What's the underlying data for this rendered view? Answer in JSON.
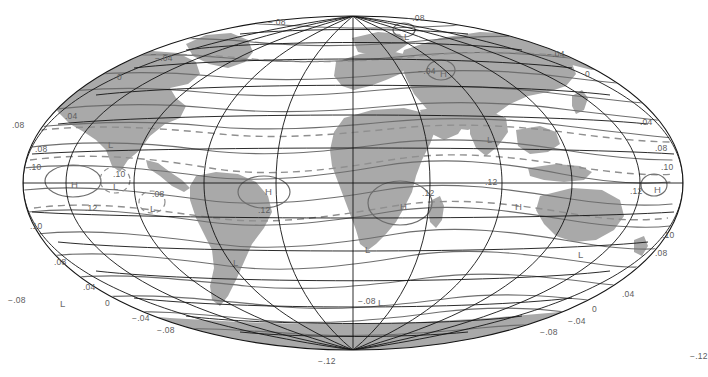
{
  "figure": {
    "type": "world-contour-map",
    "projection": "Mollweide",
    "background_color": "#ffffff",
    "land_fill": "#a9a9a9",
    "graticule_color": "#1a1a1a",
    "contour_color": "#6e6e6e",
    "dashed_contour_color": "#8a8a8a",
    "graticule": {
      "lon_step_deg": 30,
      "lat_step_deg": 30
    }
  },
  "chart_data": {
    "type": "contour",
    "title": "",
    "xlabel": "",
    "ylabel": "",
    "contour_interval": 0.04,
    "contour_levels": [
      -0.12,
      -0.08,
      -0.04,
      0,
      0.04,
      0.08,
      0.1,
      0.12
    ],
    "units": "",
    "extrema_symbols": [
      "H",
      "L"
    ],
    "labels": [
      {
        "text": "−.08",
        "x": 268,
        "y": 18
      },
      {
        "text": "−.08",
        "x": 407,
        "y": 14
      },
      {
        "text": "L",
        "x": 404,
        "y": 32
      },
      {
        "text": "−.04",
        "x": 155,
        "y": 54
      },
      {
        "text": "−.04",
        "x": 547,
        "y": 50
      },
      {
        "text": "0",
        "x": 117,
        "y": 73
      },
      {
        "text": "0",
        "x": 585,
        "y": 70
      },
      {
        "text": "−.04",
        "x": 418,
        "y": 67
      },
      {
        "text": "H",
        "x": 440,
        "y": 69
      },
      {
        "text": ".08",
        "x": 12,
        "y": 121
      },
      {
        "text": ".04",
        "x": 65,
        "y": 112
      },
      {
        "text": ".04",
        "x": 640,
        "y": 118
      },
      {
        "text": "L",
        "x": 108,
        "y": 140
      },
      {
        "text": "L",
        "x": 487,
        "y": 135
      },
      {
        "text": ".08",
        "x": 35,
        "y": 145
      },
      {
        "text": ".08",
        "x": 655,
        "y": 144
      },
      {
        "text": ".10",
        "x": 29,
        "y": 163
      },
      {
        "text": ".10",
        "x": 661,
        "y": 163
      },
      {
        "text": "H",
        "x": 71,
        "y": 180
      },
      {
        "text": ".10",
        "x": 113,
        "y": 170
      },
      {
        "text": "L",
        "x": 113,
        "y": 182
      },
      {
        "text": "H",
        "x": 265,
        "y": 187
      },
      {
        "text": ".12",
        "x": 258,
        "y": 206
      },
      {
        "text": ".08",
        "x": 152,
        "y": 190
      },
      {
        "text": "L",
        "x": 150,
        "y": 204
      },
      {
        "text": ".12",
        "x": 85,
        "y": 204
      },
      {
        "text": ".12",
        "x": 422,
        "y": 189
      },
      {
        "text": "H",
        "x": 400,
        "y": 202
      },
      {
        "text": ".12",
        "x": 485,
        "y": 178
      },
      {
        "text": "H",
        "x": 515,
        "y": 202
      },
      {
        "text": ".12",
        "x": 630,
        "y": 187
      },
      {
        "text": "H",
        "x": 654,
        "y": 185
      },
      {
        "text": ".10",
        "x": 30,
        "y": 222
      },
      {
        "text": ".10",
        "x": 662,
        "y": 231
      },
      {
        "text": "L",
        "x": 365,
        "y": 245
      },
      {
        "text": "L",
        "x": 233,
        "y": 258
      },
      {
        "text": "L",
        "x": 578,
        "y": 250
      },
      {
        "text": ".08",
        "x": 655,
        "y": 249
      },
      {
        "text": ".08",
        "x": 54,
        "y": 258
      },
      {
        "text": ".04",
        "x": 83,
        "y": 283
      },
      {
        "text": ".04",
        "x": 622,
        "y": 290
      },
      {
        "text": "−.08",
        "x": 8,
        "y": 296
      },
      {
        "text": "L",
        "x": 60,
        "y": 299
      },
      {
        "text": "0",
        "x": 105,
        "y": 299
      },
      {
        "text": "0",
        "x": 592,
        "y": 305
      },
      {
        "text": "−.08",
        "x": 358,
        "y": 297
      },
      {
        "text": "L",
        "x": 378,
        "y": 298
      },
      {
        "text": "−.04",
        "x": 132,
        "y": 314
      },
      {
        "text": "−.04",
        "x": 568,
        "y": 317
      },
      {
        "text": "−.08",
        "x": 157,
        "y": 326
      },
      {
        "text": "−.08",
        "x": 540,
        "y": 328
      },
      {
        "text": "−.12",
        "x": 318,
        "y": 357
      },
      {
        "text": "−.12",
        "x": 690,
        "y": 352
      }
    ]
  }
}
